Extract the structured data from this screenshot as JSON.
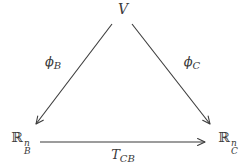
{
  "diagram": {
    "background": "#ffffff",
    "ink": "#3a3a3a",
    "nodes": {
      "v": {
        "label": "V"
      },
      "rb": {
        "base": "ℝ",
        "sup": "n",
        "sub": "B"
      },
      "rc": {
        "base": "ℝ",
        "sup": "n",
        "sub": "C"
      }
    },
    "edges": {
      "phi_b": {
        "base": "ϕ",
        "sub": "B"
      },
      "phi_c": {
        "base": "ϕ",
        "sub": "C"
      },
      "t_cb": {
        "base": "T",
        "sub": "CB"
      }
    }
  }
}
